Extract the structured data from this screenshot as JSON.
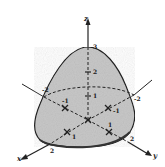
{
  "figure": {
    "colors": {
      "surface_fill": "#c8c8c8",
      "outline": "#222222",
      "axes": "#222222",
      "background": "#ffffff"
    },
    "axes": {
      "x": {
        "label": "x",
        "ticks": [
          "1",
          "2"
        ],
        "negative_ticks": [
          "-1",
          "-2"
        ]
      },
      "y": {
        "label": "y",
        "ticks": [
          "1",
          "2"
        ],
        "negative_ticks": [
          "-1",
          "-2"
        ]
      },
      "z": {
        "label": "z",
        "ticks": [
          "1",
          "2",
          "3"
        ]
      }
    },
    "labels": {
      "z_axis": "z",
      "x_axis": "x",
      "y_axis": "y",
      "z_tick_3": "3",
      "z_tick_2": "2",
      "z_tick_1": "1",
      "x_neg_2": "-2",
      "x_neg_1": "-1",
      "y_neg_2": "-2",
      "y_neg_1": "-1",
      "x_pos_1": "1",
      "x_pos_2": "2",
      "y_pos_1": "1",
      "y_pos_2": "2"
    }
  }
}
